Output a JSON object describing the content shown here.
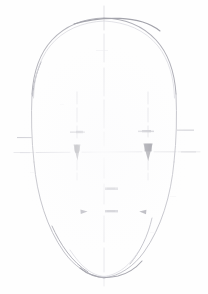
{
  "artwork": {
    "title": "Face Construction Sketch",
    "medium": "graphite pencil on white paper",
    "description": "Very faint pencil construction drawing of a frontal human head: a tall egg-shaped oval outline with a vertical centre axis, a horizontal eye line, dashed vertical pupil guides, small tick marks for brow and face edges, two dark wedge marks at the eye positions, a small horizontal nose mark and three marks at mouth level.",
    "canvas": {
      "width": 208,
      "height": 294,
      "background": "#ffffff"
    }
  },
  "palette": {
    "paper": "#ffffff",
    "outline_dark": "#9a9a9e",
    "outline_light": "#c9c9cf",
    "guide_faint": "#d9d9de",
    "guide_mid": "#c2c2c8",
    "mark_dark": "#8b8b92",
    "mark_darkest": "#7c7c84"
  },
  "geometry": {
    "head_oval": {
      "center_x": 104,
      "center_y": 150,
      "radius_x": 72,
      "radius_y": 132,
      "top_y": 18,
      "chin_y": 278,
      "left_x": 32,
      "right_x": 176
    },
    "axes": {
      "vertical_center_line": {
        "x": 104,
        "y_start": 6,
        "y_end": 286,
        "style": "dashed-faint"
      },
      "horizontal_eye_line": {
        "y": 152,
        "x_start": 14,
        "x_end": 200,
        "style": "dashed-faint"
      }
    },
    "pupil_guides": [
      {
        "name": "left-pupil-guide",
        "x": 77,
        "y_start": 92,
        "y_end": 178,
        "style": "dashed-faint"
      },
      {
        "name": "right-pupil-guide",
        "x": 148,
        "y_start": 92,
        "y_end": 178,
        "style": "dashed-faint"
      }
    ]
  },
  "marks": {
    "brow_ticks": [
      {
        "name": "brow-tick-left",
        "x": 72,
        "y": 132,
        "width": 16,
        "height": 2
      },
      {
        "name": "brow-tick-right",
        "x": 140,
        "y": 131,
        "width": 16,
        "height": 2
      }
    ],
    "edge_ticks": [
      {
        "name": "edge-tick-left",
        "x": 18,
        "y": 137,
        "width": 14,
        "height": 1
      },
      {
        "name": "edge-tick-right",
        "x": 178,
        "y": 130,
        "width": 16,
        "height": 1
      },
      {
        "name": "edge-tick-right-lower",
        "x": 182,
        "y": 152,
        "width": 14,
        "height": 1
      }
    ],
    "eye_marks": [
      {
        "name": "left-eye-wedge",
        "cx": 77,
        "cy": 151,
        "w": 7,
        "h": 14,
        "tone": "#8b8b92"
      },
      {
        "name": "right-eye-wedge",
        "cx": 148,
        "cy": 151,
        "w": 9,
        "h": 15,
        "tone": "#7c7c84"
      }
    ],
    "nose_mark": {
      "name": "nose-tick",
      "x": 106,
      "y": 188,
      "width": 13,
      "height": 3
    },
    "mouth_marks": [
      {
        "name": "mouth-mark-left",
        "x": 82,
        "y": 211,
        "width": 7,
        "height": 4
      },
      {
        "name": "mouth-mark-center",
        "x": 106,
        "y": 210,
        "width": 13,
        "height": 3
      },
      {
        "name": "mouth-mark-right",
        "x": 140,
        "y": 211,
        "width": 7,
        "height": 4
      }
    ]
  },
  "labels": {
    "head_outline": "head outline",
    "center_axis": "vertical centre axis",
    "eye_line": "horizontal eye line",
    "left_pupil_guide": "left pupil guide",
    "right_pupil_guide": "right pupil guide"
  }
}
